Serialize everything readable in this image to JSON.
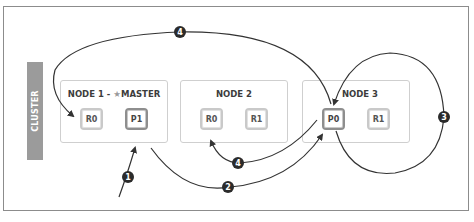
{
  "diagram": {
    "cluster_label": "CLUSTER",
    "nodes": [
      {
        "title_prefix": "NODE 1 - ",
        "master_icon": "star-icon",
        "master_glyph": "★",
        "title_suffix": "MASTER",
        "shards": [
          {
            "label": "R0",
            "type": "replica"
          },
          {
            "label": "P1",
            "type": "primary"
          }
        ]
      },
      {
        "title": "NODE 2",
        "shards": [
          {
            "label": "R0",
            "type": "replica"
          },
          {
            "label": "R1",
            "type": "replica"
          }
        ]
      },
      {
        "title": "NODE 3",
        "shards": [
          {
            "label": "P0",
            "type": "primary"
          },
          {
            "label": "R1",
            "type": "replica"
          }
        ]
      }
    ],
    "steps": [
      {
        "number": "1",
        "description": "Request arrives at Node 1 (P1)"
      },
      {
        "number": "2",
        "description": "Node 1 forwards to Node 3 (P0)"
      },
      {
        "number": "3",
        "description": "Node 3 executes on P0"
      },
      {
        "number": "4",
        "description": "P0 replicates to R0 on Node 1"
      },
      {
        "number": "4",
        "description": "P0 replicates to R0 on Node 2"
      }
    ],
    "colors": {
      "border": "#8c8c8c",
      "cluster_bar": "#9b9b9b",
      "arrow": "#333333",
      "badge": "#2b2b2b",
      "primary_border": "#8e8e8e",
      "replica_border": "#c9c9c9"
    }
  }
}
